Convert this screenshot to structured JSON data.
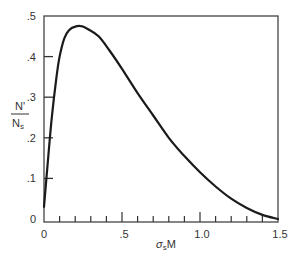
{
  "chart_data": {
    "type": "line",
    "title": "",
    "xlabel": "σsM",
    "ylabel": "N'/Ns",
    "ylabel_parts": {
      "numerator": "N'",
      "denominator": "N",
      "denominator_sub": "s"
    },
    "xlabel_parts": {
      "sigma": "σ",
      "sub": "s",
      "rest": "M"
    },
    "xlim": [
      0,
      1.5
    ],
    "ylim": [
      0,
      0.5
    ],
    "grid": false,
    "legend": null,
    "x_ticks_major": [
      0,
      0.5,
      1.0,
      1.5
    ],
    "x_tick_labels": [
      "0",
      ".5",
      "1.0",
      "1.5"
    ],
    "x_ticks_minor_step": 0.1,
    "y_ticks": [
      0,
      0.1,
      0.2,
      0.3,
      0.4,
      0.5
    ],
    "y_tick_labels": [
      "0",
      ".1",
      ".2",
      ".3",
      ".4",
      ".5"
    ],
    "series": [
      {
        "name": "N'/Ns",
        "color": "#1a1a1a",
        "x": [
          0,
          0.02,
          0.05,
          0.08,
          0.1,
          0.13,
          0.16,
          0.2,
          0.24,
          0.28,
          0.35,
          0.42,
          0.5,
          0.6,
          0.7,
          0.8,
          0.9,
          1.0,
          1.1,
          1.2,
          1.3,
          1.4,
          1.5
        ],
        "y": [
          0.03,
          0.12,
          0.25,
          0.35,
          0.4,
          0.445,
          0.465,
          0.474,
          0.475,
          0.468,
          0.45,
          0.415,
          0.37,
          0.31,
          0.255,
          0.2,
          0.155,
          0.115,
          0.08,
          0.05,
          0.027,
          0.01,
          0.0
        ]
      }
    ]
  }
}
